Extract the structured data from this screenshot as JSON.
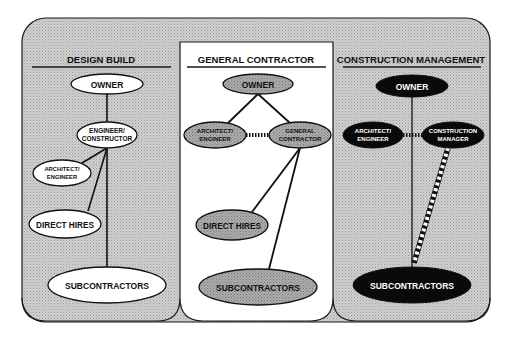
{
  "diagram": {
    "colors": {
      "background": "#ffffff",
      "panel_gray": "#c8c8c8",
      "panel_white": "#ffffff",
      "node_gray": "#a6a6a6",
      "node_black": "#0a0a0a",
      "stroke": "#1a1a1a"
    },
    "panels": [
      {
        "title": "DESIGN BUILD",
        "nodes": {
          "owner": "OWNER",
          "engineer_constructor": [
            "ENGINEER/",
            "CONSTRUCTOR"
          ],
          "architect_engineer": [
            "ARCHITECT/",
            "ENGINEER"
          ],
          "direct_hires": "DIRECT HIRES",
          "subcontractors": "SUBCONTRACTORS"
        }
      },
      {
        "title": "GENERAL CONTRACTOR",
        "nodes": {
          "owner": "OWNER",
          "architect_engineer": [
            "ARCHITECT/",
            "ENGINEER"
          ],
          "general_contractor": [
            "GENERAL",
            "CONTRACTOR"
          ],
          "direct_hires": "DIRECT HIRES",
          "subcontractors": "SUBCONTRACTORS"
        }
      },
      {
        "title": "CONSTRUCTION MANAGEMENT",
        "nodes": {
          "owner": "OWNER",
          "architect_engineer": [
            "ARCHITECT/",
            "ENGINEER"
          ],
          "construction_manager": [
            "CONSTRUCTION",
            "MANAGER"
          ],
          "subcontractors": "SUBCONTRACTORS"
        }
      }
    ]
  }
}
